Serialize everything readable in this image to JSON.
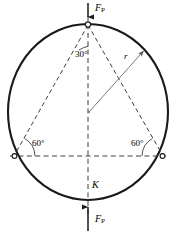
{
  "figure": {
    "labels": {
      "force_top": "F",
      "force_top_sub": "P",
      "force_bottom": "F",
      "force_bottom_sub": "P",
      "angle_apex": "30°",
      "angle_left": "60°",
      "angle_right": "60°",
      "radius": "r",
      "point_k": "K"
    },
    "colors": {
      "circle_stroke": "#1a1a1a",
      "dashed_stroke": "#3d3d3d",
      "radius_stroke": "#7a7a7a",
      "text": "#000000",
      "background": "#ffffff"
    },
    "geometry": {
      "center_x": 88,
      "center_y": 112,
      "radius_x": 80,
      "radius_y": 88,
      "apex_x": 88,
      "apex_y": 24,
      "left_vertex_x": 14,
      "left_vertex_y": 156,
      "right_vertex_x": 163,
      "right_vertex_y": 156,
      "bottom_x": 88,
      "bottom_y": 200
    }
  }
}
